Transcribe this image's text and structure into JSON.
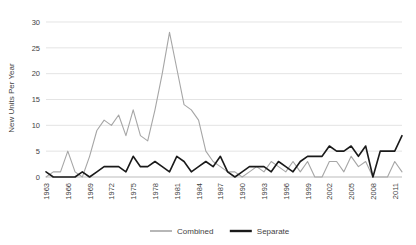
{
  "chart_data": {
    "type": "line",
    "title": "",
    "xlabel": "",
    "ylabel": "New Units Per Year",
    "ylim": [
      0,
      30
    ],
    "yticks": [
      0,
      5,
      10,
      15,
      20,
      25,
      30
    ],
    "xlim": [
      1963,
      2012
    ],
    "grid": true,
    "legend_position": "bottom",
    "x": [
      1963,
      1964,
      1965,
      1966,
      1967,
      1968,
      1969,
      1970,
      1971,
      1972,
      1973,
      1974,
      1975,
      1976,
      1977,
      1978,
      1979,
      1980,
      1981,
      1982,
      1983,
      1984,
      1985,
      1986,
      1987,
      1988,
      1989,
      1990,
      1991,
      1992,
      1993,
      1994,
      1995,
      1996,
      1997,
      1998,
      1999,
      2000,
      2001,
      2002,
      2003,
      2004,
      2005,
      2006,
      2007,
      2008,
      2009,
      2010,
      2011,
      2012
    ],
    "xtick_labels": [
      "1963",
      "1966",
      "1969",
      "1972",
      "1975",
      "1978",
      "1981",
      "1984",
      "1987",
      "1990",
      "1993",
      "1996",
      "1999",
      "2002",
      "2005",
      "2008",
      "2011"
    ],
    "xtick_values": [
      1963,
      1966,
      1969,
      1972,
      1975,
      1978,
      1981,
      1984,
      1987,
      1990,
      1993,
      1996,
      1999,
      2002,
      2005,
      2008,
      2011
    ],
    "series": [
      {
        "name": "Combined",
        "color": "#a6a6a6",
        "values": [
          0,
          1,
          1,
          5,
          1,
          0,
          4,
          9,
          11,
          10,
          12,
          8,
          13,
          8,
          7,
          13,
          20,
          28,
          21,
          14,
          13,
          11,
          5,
          3,
          2,
          1,
          1,
          0,
          1,
          2,
          1,
          3,
          2,
          1,
          3,
          1,
          3,
          0,
          0,
          3,
          3,
          1,
          4,
          2,
          3,
          0,
          0,
          0,
          3,
          1
        ]
      },
      {
        "name": "Separate",
        "color": "#1a1a1a",
        "values": [
          1,
          0,
          0,
          0,
          0,
          1,
          0,
          1,
          2,
          2,
          2,
          1,
          4,
          2,
          2,
          3,
          2,
          1,
          4,
          3,
          1,
          2,
          3,
          2,
          4,
          1,
          0,
          1,
          2,
          2,
          2,
          1,
          3,
          2,
          1,
          3,
          4,
          4,
          4,
          6,
          5,
          5,
          6,
          4,
          6,
          0,
          5,
          5,
          5,
          8
        ]
      }
    ],
    "legend": [
      {
        "label": "Combined",
        "color": "#a6a6a6"
      },
      {
        "label": "Separate",
        "color": "#1a1a1a"
      }
    ]
  }
}
